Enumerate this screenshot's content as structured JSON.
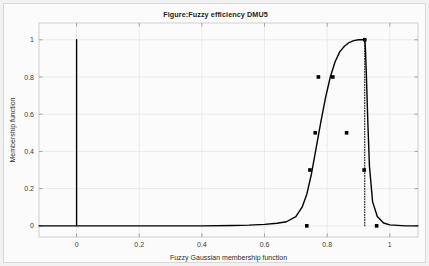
{
  "figure": {
    "title": "Figure:Fuzzy efficiency DMU5",
    "background_color": "#f2f2f2",
    "panel_color": "#fbfbfb",
    "frame_color": "#cfcfcf",
    "line_color": "#000000",
    "marker_color": "#000000"
  },
  "chart_data": {
    "type": "line",
    "title": "Figure:Fuzzy efficiency DMU5",
    "xlabel": "Fuzzy Gaussian membership function",
    "ylabel": "Membership function",
    "xlim": [
      -0.12,
      1.09
    ],
    "ylim": [
      -0.06,
      1.09
    ],
    "xticks": [
      0,
      0.2,
      0.4,
      0.6,
      0.8,
      1
    ],
    "xtick_labels": [
      "0",
      "0.2",
      "0.4",
      "0.6",
      "0.8",
      "1"
    ],
    "yticks": [
      0,
      0.2,
      0.4,
      0.6,
      0.8,
      1
    ],
    "ytick_labels": [
      "0",
      "0.2",
      "0.4",
      "0.6",
      "0.8",
      "1"
    ],
    "grid": true,
    "legend": null,
    "series": [
      {
        "name": "Fuzzy Gaussian membership curve",
        "type": "line",
        "x": [
          -0.12,
          0.0,
          0.05,
          0.1,
          0.2,
          0.3,
          0.4,
          0.5,
          0.55,
          0.6,
          0.64,
          0.67,
          0.7,
          0.72,
          0.735,
          0.75,
          0.765,
          0.78,
          0.795,
          0.81,
          0.825,
          0.84,
          0.855,
          0.87,
          0.885,
          0.9,
          0.915,
          0.918,
          0.92,
          0.922,
          0.925,
          0.93,
          0.935,
          0.945,
          0.96,
          0.98,
          1.0,
          1.05,
          1.09
        ],
        "y": [
          0.0,
          0.0,
          0.0,
          0.0,
          0.0,
          0.0,
          0.0,
          0.002,
          0.004,
          0.008,
          0.014,
          0.022,
          0.05,
          0.1,
          0.17,
          0.28,
          0.42,
          0.56,
          0.69,
          0.8,
          0.88,
          0.935,
          0.965,
          0.985,
          0.995,
          1.0,
          1.0,
          1.0,
          1.0,
          0.96,
          0.82,
          0.55,
          0.32,
          0.13,
          0.05,
          0.015,
          0.005,
          0.0,
          0.0
        ]
      },
      {
        "name": "Left vertical segment at x=0",
        "type": "line",
        "x": [
          0.0,
          0.0
        ],
        "y": [
          0.0,
          1.0
        ]
      },
      {
        "name": "Right dotted vertical segment",
        "type": "line",
        "style": "dotted",
        "x": [
          0.92,
          0.92
        ],
        "y": [
          0.0,
          1.0
        ]
      }
    ],
    "points": [
      {
        "x": 0.735,
        "y": 0.0
      },
      {
        "x": 0.745,
        "y": 0.3
      },
      {
        "x": 0.762,
        "y": 0.5
      },
      {
        "x": 0.772,
        "y": 0.8
      },
      {
        "x": 0.818,
        "y": 0.8
      },
      {
        "x": 0.862,
        "y": 0.5
      },
      {
        "x": 0.92,
        "y": 1.0
      },
      {
        "x": 0.918,
        "y": 0.3
      },
      {
        "x": 0.958,
        "y": 0.0
      }
    ]
  }
}
